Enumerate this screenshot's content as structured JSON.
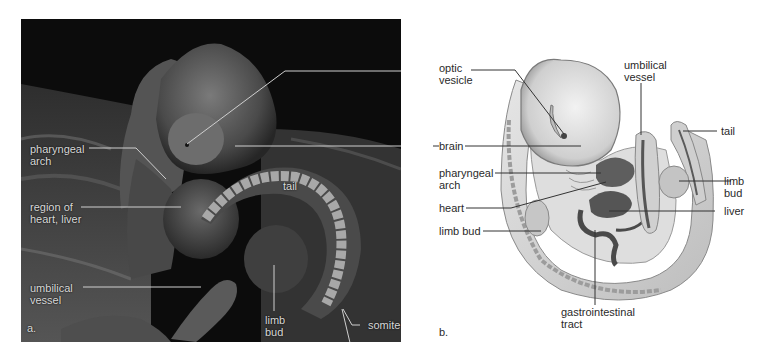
{
  "figure": {
    "panel_a": {
      "letter": "a.",
      "type": "scanning electron micrograph of embryo",
      "labels": {
        "pharyngeal_arch": [
          "pharyngeal",
          "arch"
        ],
        "region_heart_liver": [
          "region of",
          "heart, liver"
        ],
        "umbilical_vessel": [
          "umbilical",
          "vessel"
        ],
        "tail": "tail",
        "limb_bud": [
          "limb",
          "bud"
        ],
        "somite": "somite"
      }
    },
    "panel_b": {
      "letter": "b.",
      "type": "illustration of embryo",
      "labels": {
        "optic_vesicle": [
          "optic",
          "vesicle"
        ],
        "brain": "brain",
        "pharyngeal_arch": [
          "pharyngeal",
          "arch"
        ],
        "heart": "heart",
        "limb_bud_left": "limb bud",
        "umbilical_vessel": [
          "umbilical",
          "vessel"
        ],
        "tail": "tail",
        "limb_bud_right": "limb bud",
        "liver": "liver",
        "gastrointestinal_tract": [
          "gastrointestinal",
          "tract"
        ]
      }
    },
    "colors": {
      "photo_background": "#0c0c0c",
      "photo_label": "#d8d8d8",
      "illustration_body": "#d9d9d9",
      "illustration_organ": "#555555",
      "label_text": "#2a2a2a",
      "leader_line": "#333333"
    }
  }
}
